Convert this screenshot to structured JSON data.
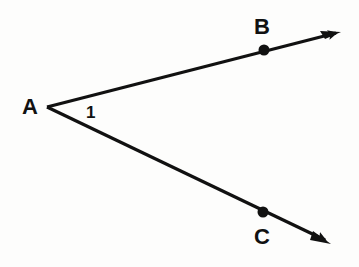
{
  "diagram": {
    "title": "",
    "vertex": {
      "label": "A",
      "x": 47,
      "y": 107
    },
    "angle_label": "1",
    "rays": [
      {
        "name": "ray-AB",
        "point_label": "B",
        "point": {
          "x": 264,
          "y": 50
        },
        "tip": {
          "x": 341,
          "y": 32
        }
      },
      {
        "name": "ray-AC",
        "point_label": "C",
        "point": {
          "x": 263,
          "y": 212
        },
        "tip": {
          "x": 330,
          "y": 243
        }
      }
    ],
    "colors": {
      "ink": "#111111",
      "background": "#fdfdfc"
    }
  }
}
